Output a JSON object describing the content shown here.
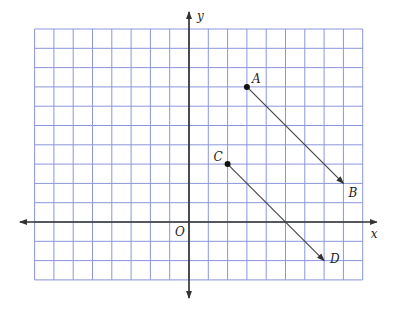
{
  "diagram": {
    "type": "coordinate-grid",
    "grid": {
      "x_min": -8,
      "x_max": 9,
      "y_min": -3,
      "y_max": 10,
      "origin_px": [
        189,
        222
      ],
      "unit_px": 19.3,
      "grid_color": "#8b95dc",
      "axis_color": "#333333"
    },
    "axes": {
      "x_label": "x",
      "y_label": "y",
      "origin_label": "O"
    },
    "points": [
      {
        "name": "A",
        "x": 3,
        "y": 7,
        "dot": true
      },
      {
        "name": "B",
        "x": 8,
        "y": 2,
        "dot": false
      },
      {
        "name": "C",
        "x": 2,
        "y": 3,
        "dot": true
      },
      {
        "name": "D",
        "x": 7,
        "y": -2,
        "dot": false
      }
    ],
    "rays": [
      {
        "from": "A",
        "to": "B",
        "label": "ray AB"
      },
      {
        "from": "C",
        "to": "D",
        "label": "ray CD"
      }
    ]
  }
}
